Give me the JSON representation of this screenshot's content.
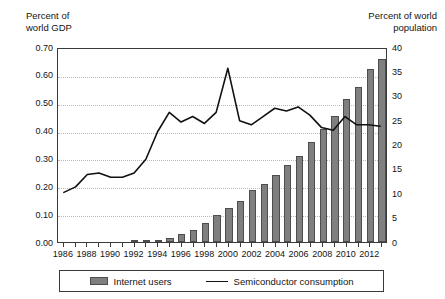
{
  "axes": {
    "left_caption": "Percent of\nworld GDP",
    "right_caption": "Percent of world\npopulation",
    "left_ticks": [
      "0.70",
      "0.60",
      "0.50",
      "0.40",
      "0.30",
      "0.20",
      "0.10",
      "0.00"
    ],
    "right_ticks": [
      "40",
      "35",
      "30",
      "25",
      "20",
      "15",
      "10",
      "5",
      "0"
    ],
    "x_tick_labels": [
      "1986",
      "1988",
      "1990",
      "1992",
      "1994",
      "1996",
      "1998",
      "2000",
      "2002",
      "2004",
      "2006",
      "2008",
      "2010",
      "2012"
    ]
  },
  "legend": {
    "bar_label": "Internet users",
    "line_label": "Semiconductor consumption",
    "bar_swatch": "bar-swatch",
    "line_swatch": "line-swatch"
  },
  "colors": {
    "bar_fill": "#7f7f7f",
    "bar_stroke": "#4d4d4d",
    "line": "#111111",
    "axis": "#3a3a3a",
    "grid": "#b9b9b9"
  },
  "chart_data": {
    "type": "bar",
    "title": "",
    "xlabel": "",
    "ylabel": "Percent of world GDP",
    "y2label": "Percent of world population",
    "ylim": [
      0.0,
      0.7
    ],
    "y2lim": [
      0,
      40
    ],
    "grid": true,
    "legend_position": "bottom",
    "categories": [
      1986,
      1987,
      1988,
      1989,
      1990,
      1991,
      1992,
      1993,
      1994,
      1995,
      1996,
      1997,
      1998,
      1999,
      2000,
      2001,
      2002,
      2003,
      2004,
      2005,
      2006,
      2007,
      2008,
      2009,
      2010,
      2011,
      2012,
      2013
    ],
    "series": [
      {
        "name": "Internet users",
        "type": "bar",
        "axis": "right",
        "unit": "percent of world population",
        "values": [
          0,
          0,
          0,
          0,
          0,
          0,
          0.1,
          0.3,
          0.5,
          0.8,
          1.6,
          2.5,
          3.8,
          5.6,
          7.0,
          8.5,
          10.7,
          11.9,
          13.8,
          15.8,
          17.6,
          20.6,
          23.2,
          25.8,
          29.4,
          31.8,
          35.5,
          37.5
        ]
      },
      {
        "name": "Semiconductor consumption",
        "type": "line",
        "axis": "left",
        "unit": "percent of world GDP",
        "values": [
          0.18,
          0.2,
          0.245,
          0.25,
          0.235,
          0.235,
          0.25,
          0.3,
          0.4,
          0.47,
          0.435,
          0.455,
          0.43,
          0.47,
          0.63,
          0.44,
          0.425,
          0.455,
          0.485,
          0.475,
          0.49,
          0.46,
          0.415,
          0.405,
          0.455,
          0.425,
          0.425,
          0.42
        ]
      }
    ]
  }
}
